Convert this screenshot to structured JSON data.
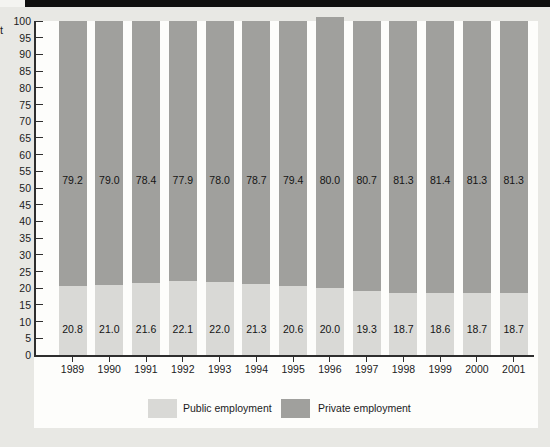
{
  "figure": {
    "top_bar_color": "#101010",
    "background_color": "#e8e8e4",
    "panel_color": "#fdfdfb",
    "axis_color": "#2e2e2e",
    "ylabel_fragment": "t"
  },
  "chart_data": {
    "type": "bar",
    "stacked": true,
    "title": "",
    "xlabel": "",
    "ylabel_visible_fragment": "t",
    "categories": [
      "1989",
      "1990",
      "1991",
      "1992",
      "1993",
      "1994",
      "1995",
      "1996",
      "1997",
      "1998",
      "1999",
      "2000",
      "2001"
    ],
    "series": [
      {
        "name": "Public employment",
        "color": "#d9d9d6",
        "values": [
          20.8,
          21.0,
          21.6,
          22.1,
          22.0,
          21.3,
          20.6,
          20.0,
          19.3,
          18.7,
          18.6,
          18.7,
          18.7
        ]
      },
      {
        "name": "Private employment",
        "color": "#a0a09d",
        "values": [
          79.2,
          79.0,
          78.4,
          77.9,
          78.0,
          78.7,
          79.4,
          80.0,
          80.7,
          81.3,
          81.4,
          81.3,
          81.3
        ]
      }
    ],
    "ylim": [
      0,
      100
    ],
    "yticks": [
      0,
      5,
      10,
      15,
      20,
      25,
      30,
      35,
      40,
      45,
      50,
      55,
      60,
      65,
      70,
      75,
      80,
      85,
      90,
      95,
      100
    ],
    "value_labels": true,
    "grid": false,
    "legend_position": "bottom",
    "overflow_bar_category": "1996"
  },
  "legend": {
    "items": [
      {
        "label": "Public employment",
        "color": "#d9d9d6"
      },
      {
        "label": "Private employment",
        "color": "#a0a09d"
      }
    ]
  }
}
